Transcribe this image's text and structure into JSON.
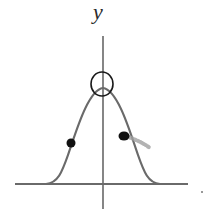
{
  "diagram": {
    "type": "bell-curve-sketch",
    "y_axis_label": "y",
    "colors": {
      "axis": "#444444",
      "curve": "#6a6a6a",
      "marker": "#111111",
      "smudge": "#9a9a9a",
      "background": "#ffffff"
    },
    "annotations": [
      {
        "name": "peak-circle",
        "description": "circle around the maximum"
      },
      {
        "name": "left-inflection-dot",
        "description": "dot on left inflection point"
      },
      {
        "name": "right-inflection-dot",
        "description": "dot on right inflection point"
      }
    ]
  }
}
